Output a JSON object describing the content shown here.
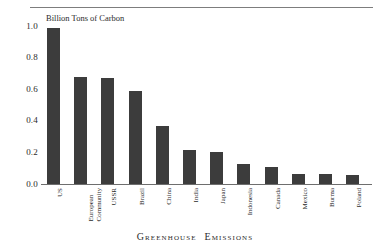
{
  "figure": {
    "caption": "Greenhouse Emissions",
    "caption_words": [
      "Greenhouse",
      "Emissions"
    ],
    "axis_title": "Billion Tons of Carbon",
    "bar_color": "#3c3c3c",
    "rule_color": "#7d7d7d",
    "axis_color": "#6e6e6e",
    "background": "#ffffff"
  },
  "chart_data": {
    "type": "bar",
    "subtitle": "",
    "ylabel": "Billion Tons of Carbon",
    "xlabel": "",
    "ylim": [
      0.0,
      1.0
    ],
    "yticks": [
      "1.0",
      "0.8",
      "0.6",
      "0.4",
      "0.2",
      "0.0"
    ],
    "ytick_values": [
      1.0,
      0.8,
      0.6,
      0.4,
      0.2,
      0.0
    ],
    "grid": false,
    "legend": "none",
    "orientation": "vertical",
    "categories": [
      "US",
      "European Community",
      "USSR",
      "Brazil",
      "China",
      "India",
      "Japan",
      "Indonesia",
      "Canada",
      "Mexico",
      "Burma",
      "Poland"
    ],
    "values": [
      0.99,
      0.68,
      0.67,
      0.59,
      0.37,
      0.215,
      0.205,
      0.125,
      0.105,
      0.065,
      0.063,
      0.06
    ],
    "bars": [
      {
        "label": "US",
        "label_lines": [
          "US"
        ],
        "value": 0.99
      },
      {
        "label": "European Community",
        "label_lines": [
          "European",
          "Community"
        ],
        "value": 0.68
      },
      {
        "label": "USSR",
        "label_lines": [
          "USSR"
        ],
        "value": 0.67
      },
      {
        "label": "Brazil",
        "label_lines": [
          "Brazil"
        ],
        "value": 0.59
      },
      {
        "label": "China",
        "label_lines": [
          "China"
        ],
        "value": 0.37
      },
      {
        "label": "India",
        "label_lines": [
          "India"
        ],
        "value": 0.215
      },
      {
        "label": "Japan",
        "label_lines": [
          "Japan"
        ],
        "value": 0.205
      },
      {
        "label": "Indonesia",
        "label_lines": [
          "Indonesia"
        ],
        "value": 0.125
      },
      {
        "label": "Canada",
        "label_lines": [
          "Canada"
        ],
        "value": 0.105
      },
      {
        "label": "Mexico",
        "label_lines": [
          "Mexico"
        ],
        "value": 0.065
      },
      {
        "label": "Burma",
        "label_lines": [
          "Burma"
        ],
        "value": 0.063
      },
      {
        "label": "Poland",
        "label_lines": [
          "Poland"
        ],
        "value": 0.06
      }
    ]
  }
}
